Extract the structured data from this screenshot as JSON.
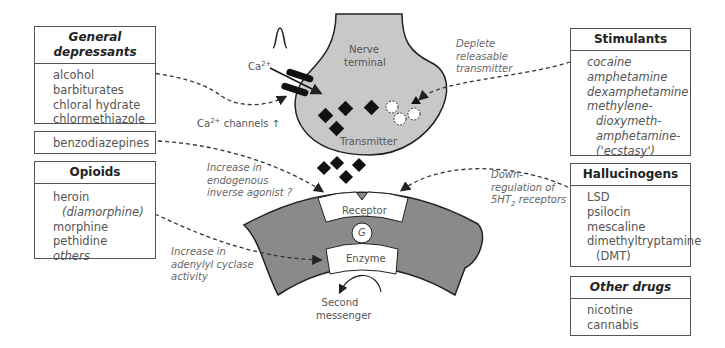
{
  "boxes": {
    "general_depressants": {
      "title_line1": "General",
      "title_line2": "depressants",
      "items": [
        "alcohol",
        "barbiturates",
        "chloral hydrate",
        "chlormethiazole"
      ]
    },
    "benzodiazepines": {
      "label": "benzodiazepines"
    },
    "opioids": {
      "title": "Opioids",
      "items": [
        "heroin",
        "(diamorphine)",
        "morphine",
        "pethidine",
        "others"
      ]
    },
    "stimulants": {
      "title": "Stimulants",
      "items": [
        "cocaine",
        "amphetamine",
        "dexamphetamine",
        "methylene-",
        "dioxymeth-",
        "amphetamine-",
        "('ecstasy')"
      ]
    },
    "hallucinogens": {
      "title": "Hallucinogens",
      "items": [
        "LSD",
        "psilocin",
        "mescaline",
        "dimethyltryptamine",
        "(DMT)"
      ]
    },
    "other_drugs": {
      "title": "Other drugs",
      "items": [
        "nicotine",
        "cannabis"
      ]
    }
  },
  "labels": {
    "nerve_terminal_1": "Nerve",
    "nerve_terminal_2": "terminal",
    "transmitter": "Transmitter",
    "ca_ion": "Ca",
    "ca_sup": "2+",
    "ca_channels": "Ca",
    "ca_channels_sup": "2+",
    "ca_channels_rest": " channels",
    "ca_channels_arrow": "↑",
    "deplete_1": "Deplete",
    "deplete_2": "releasable",
    "deplete_3": "transmitter",
    "inverse_1": "Increase in",
    "inverse_2": "endogenous",
    "inverse_3": "inverse agonist ?",
    "down_1": "Down-",
    "down_2": "regulation of",
    "down_3a": "5HT",
    "down_3sub": "2",
    "down_3b": " receptors",
    "adenylyl_1": "Increase in",
    "adenylyl_2": "adenylyl cyclase",
    "adenylyl_3": "activity",
    "receptor": "Receptor",
    "g_protein": "G",
    "enzyme": "Enzyme",
    "second_1": "Second",
    "second_2": "messenger"
  },
  "colors": {
    "terminal_fill": "#c8c8c8",
    "membrane_fill": "#8a8a8a",
    "outline": "#222222",
    "dash": "#333333"
  }
}
